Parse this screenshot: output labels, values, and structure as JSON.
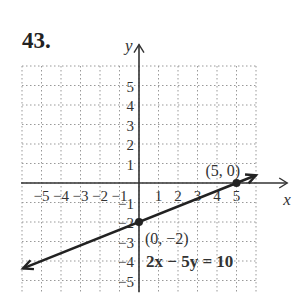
{
  "problem_number": "43.",
  "chart_data": {
    "type": "line",
    "title": "",
    "equation": "2x − 5y = 10",
    "xlabel": "x",
    "ylabel": "y",
    "xlim": [
      -6,
      6
    ],
    "ylim": [
      -5.5,
      6
    ],
    "grid": true,
    "x_ticks": [
      "−5",
      "−4",
      "−3",
      "−2",
      "−1",
      "1",
      "2",
      "3",
      "4",
      "5"
    ],
    "y_ticks": [
      "5",
      "4",
      "3",
      "2",
      "1",
      "−1",
      "−2",
      "−3",
      "−4",
      "−5"
    ],
    "series": [
      {
        "name": "2x − 5y = 10",
        "x": [
          -6,
          6
        ],
        "y": [
          -4.4,
          0.4
        ]
      }
    ],
    "points": [
      {
        "x": 0,
        "y": -2,
        "label": "(0, −2)"
      },
      {
        "x": 5,
        "y": 0,
        "label": "(5, 0)"
      }
    ]
  }
}
